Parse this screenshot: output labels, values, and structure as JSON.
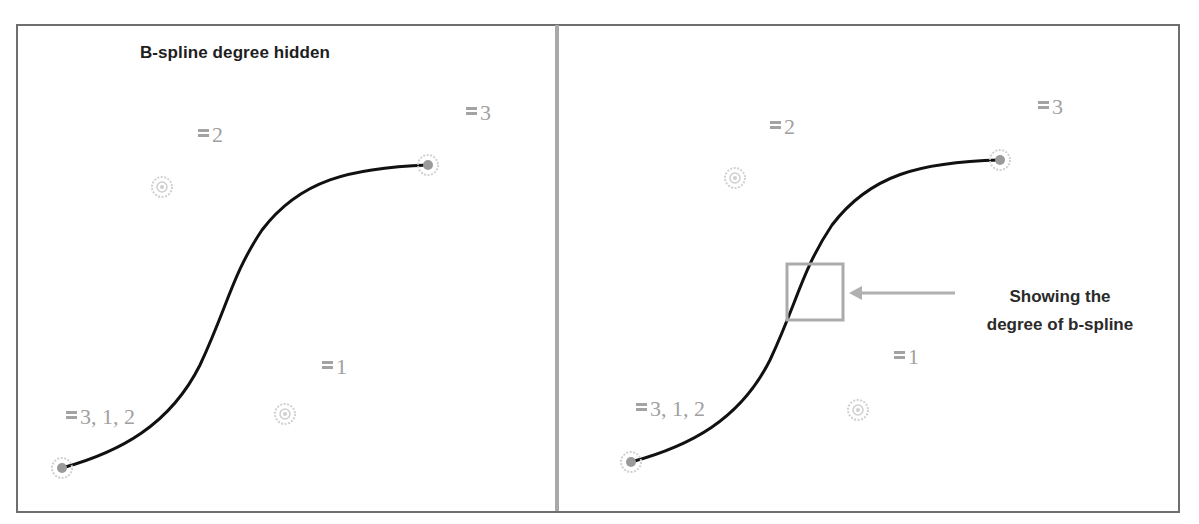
{
  "figure": {
    "colors": {
      "frame": "#6e6e6e",
      "divider": "#a9a9a9",
      "curve": "#111111",
      "control_point_ring": "#c8c8c8",
      "control_point_fill": "#9a9a9a",
      "label_text": "#a0a0a0",
      "title_text": "#1e1e1e",
      "callout_box": "#ababab",
      "callout_arrow": "#b0b0b0",
      "callout_text": "#2a2a2a"
    }
  },
  "left_panel": {
    "title": "B-spline degree hidden",
    "control_points": [
      {
        "id": "p0",
        "x": 62,
        "y": 468,
        "type": "endpoint"
      },
      {
        "id": "p1",
        "x": 162,
        "y": 187,
        "type": "control"
      },
      {
        "id": "p2",
        "x": 285,
        "y": 414,
        "type": "control"
      },
      {
        "id": "p3",
        "x": 428,
        "y": 165,
        "type": "endpoint"
      }
    ],
    "labels": [
      {
        "id": "label-p0",
        "text": "3, 1, 2",
        "x": 66,
        "y": 406
      },
      {
        "id": "label-p1",
        "text": "2",
        "x": 198,
        "y": 124
      },
      {
        "id": "label-p2",
        "text": "1",
        "x": 322,
        "y": 356
      },
      {
        "id": "label-p3",
        "text": "3",
        "x": 466,
        "y": 102
      }
    ]
  },
  "right_panel": {
    "control_points": [
      {
        "id": "p0",
        "x": 631,
        "y": 462,
        "type": "endpoint"
      },
      {
        "id": "p1",
        "x": 735,
        "y": 178,
        "type": "control"
      },
      {
        "id": "p2",
        "x": 858,
        "y": 410,
        "type": "control"
      },
      {
        "id": "p3",
        "x": 1000,
        "y": 160,
        "type": "endpoint"
      }
    ],
    "labels": [
      {
        "id": "label-p0",
        "text": "3, 1, 2",
        "x": 636,
        "y": 398
      },
      {
        "id": "label-p1",
        "text": "2",
        "x": 770,
        "y": 116
      },
      {
        "id": "label-p2",
        "text": "1",
        "x": 894,
        "y": 346
      },
      {
        "id": "label-p3",
        "text": "3",
        "x": 1038,
        "y": 96
      }
    ],
    "callout": {
      "line1": "Showing the",
      "line2": "degree of b-spline",
      "box": {
        "x": 787,
        "y": 264,
        "width": 56,
        "height": 56
      },
      "arrow": {
        "x1": 955,
        "y1": 293,
        "x2": 849,
        "y2": 293
      }
    }
  }
}
